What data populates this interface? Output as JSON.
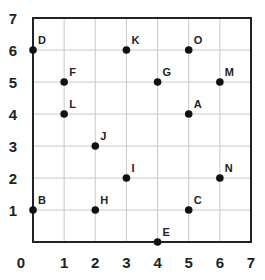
{
  "diagram": {
    "type": "coordinate-grid",
    "x_range": [
      0,
      7
    ],
    "y_range": [
      0,
      7
    ],
    "x_ticks": [
      "0",
      "1",
      "2",
      "3",
      "4",
      "5",
      "6",
      "7"
    ],
    "y_ticks": [
      "1",
      "2",
      "3",
      "4",
      "5",
      "6",
      "7"
    ],
    "grid_color": "#c8c8c8",
    "border_color": "#222222",
    "point_color": "#111111",
    "points": [
      {
        "label": "A",
        "x": 5,
        "y": 4
      },
      {
        "label": "B",
        "x": 0,
        "y": 1
      },
      {
        "label": "C",
        "x": 5,
        "y": 1
      },
      {
        "label": "D",
        "x": 0,
        "y": 6
      },
      {
        "label": "E",
        "x": 4,
        "y": 0
      },
      {
        "label": "F",
        "x": 1,
        "y": 5
      },
      {
        "label": "G",
        "x": 4,
        "y": 5
      },
      {
        "label": "H",
        "x": 2,
        "y": 1
      },
      {
        "label": "I",
        "x": 3,
        "y": 2
      },
      {
        "label": "J",
        "x": 2,
        "y": 3
      },
      {
        "label": "K",
        "x": 3,
        "y": 6
      },
      {
        "label": "L",
        "x": 1,
        "y": 4
      },
      {
        "label": "M",
        "x": 6,
        "y": 5
      },
      {
        "label": "N",
        "x": 6,
        "y": 2
      },
      {
        "label": "O",
        "x": 5,
        "y": 6
      }
    ]
  }
}
